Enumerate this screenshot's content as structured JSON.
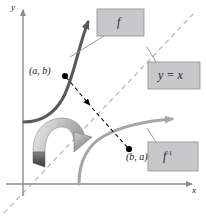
{
  "figure": {
    "axes": {
      "x_label": "x",
      "y_label": "y"
    },
    "points": [
      {
        "name": "point-ab",
        "label": "(a, b)",
        "on_curve": "f"
      },
      {
        "name": "point-ba",
        "label": "(b, a)",
        "on_curve": "f-inverse"
      }
    ],
    "callouts": [
      {
        "name": "callout-f",
        "label": "f"
      },
      {
        "name": "callout-y-equals-x",
        "label": "y = x"
      },
      {
        "name": "callout-f-inverse",
        "label": "f",
        "exponent": "-1"
      }
    ],
    "curves": [
      {
        "name": "curve-f",
        "label": "f",
        "color": "#59595b"
      },
      {
        "name": "curve-f-inverse",
        "label": "f^-1",
        "color": "#a6a6a8"
      },
      {
        "name": "line-y-equals-x",
        "label": "y = x",
        "color": "#b9b9bb",
        "style": "dashed"
      },
      {
        "name": "reflection-connector",
        "label": "(a, b) to (b, a)",
        "color": "#000000",
        "style": "dashed"
      }
    ],
    "colors": {
      "background": "#ffffff",
      "axis": "#8b8b8d",
      "curve_f": "#59595b",
      "curve_f_inverse": "#a6a6a8",
      "dashed_line": "#b9b9bb",
      "callout_box_fill": "#c8c8ca",
      "callout_box_stroke": "#8e8e90",
      "leader_line": "#9a9a9c",
      "point_dot": "#000000",
      "reflect_arrow_light": "#d7d7d9",
      "reflect_arrow_dark": "#6e6e70"
    }
  }
}
